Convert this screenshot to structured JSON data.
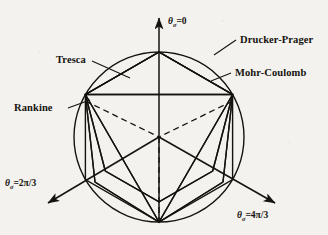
{
  "figure": {
    "background_color": "#f3f2ee",
    "ink_color": "#15130f",
    "center": {
      "x": 159,
      "y": 137
    },
    "circle_radius": 85
  },
  "axes": [
    {
      "id": "theta-0",
      "label_theta": "θ",
      "label_sub": "σ",
      "label_value": "=0",
      "angle_deg": 90,
      "direction": "up",
      "tip": {
        "x": 159,
        "y": 14
      },
      "label_pos": {
        "x": 168,
        "y": 24
      }
    },
    {
      "id": "theta-2pi-3",
      "label_theta": "θ",
      "label_sub": "σ",
      "label_value": "=2π/3",
      "angle_deg": 210,
      "direction": "down-left",
      "tip": {
        "x": 44,
        "y": 206
      },
      "label_pos": {
        "x": 5,
        "y": 186
      }
    },
    {
      "id": "theta-4pi-3",
      "label_theta": "θ",
      "label_sub": "σ",
      "label_value": "=4π/3",
      "angle_deg": 330,
      "direction": "down-right",
      "tip": {
        "x": 279,
        "y": 206
      },
      "label_pos": {
        "x": 237,
        "y": 218
      }
    }
  ],
  "criteria": [
    {
      "id": "drucker-prager",
      "label": "Drucker-Prager",
      "shape": "circle",
      "label_pos": {
        "x": 240,
        "y": 43
      },
      "leader": [
        {
          "x": 236,
          "y": 40
        },
        {
          "x": 214,
          "y": 55
        }
      ]
    },
    {
      "id": "mohr-coulomb",
      "label": "Mohr-Coulomb",
      "shape": "irregular-hexagon",
      "label_pos": {
        "x": 235,
        "y": 76
      },
      "leader": [
        {
          "x": 231,
          "y": 73
        },
        {
          "x": 211,
          "y": 81
        }
      ]
    },
    {
      "id": "tresca",
      "label": "Tresca",
      "shape": "regular-hexagon",
      "label_pos": {
        "x": 56,
        "y": 63
      },
      "leader": [
        {
          "x": 92,
          "y": 61
        },
        {
          "x": 130,
          "y": 78
        }
      ]
    },
    {
      "id": "rankine",
      "label": "Rankine",
      "shape": "triangle",
      "label_pos": {
        "x": 14,
        "y": 111
      },
      "leader": [
        {
          "x": 68,
          "y": 108
        },
        {
          "x": 90,
          "y": 100
        }
      ]
    }
  ]
}
